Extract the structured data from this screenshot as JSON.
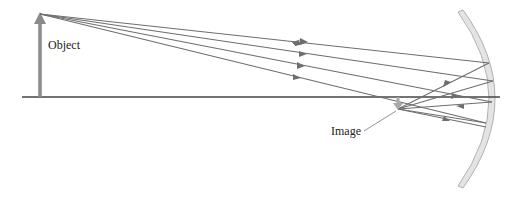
{
  "diagram": {
    "type": "concave-mirror-ray-diagram",
    "labels": {
      "object": "Object",
      "image": "Image"
    },
    "colors": {
      "ray": "#6e6e6e",
      "axis": "#444444",
      "object_arrow": "#8a8a8a",
      "image_arrow": "#a8a8a8",
      "mirror_fill": "#e4e4e4",
      "mirror_stroke": "#b0b0b0"
    },
    "object_tip": [
      40,
      14
    ],
    "object_base": [
      40,
      97
    ],
    "axis_y": 97,
    "image_pos": [
      398,
      107
    ],
    "rays_count": 4
  }
}
